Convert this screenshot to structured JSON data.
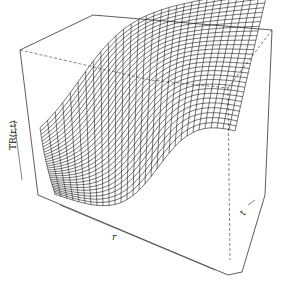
{
  "chart_data": {
    "type": "surface3d",
    "title": "",
    "xlabel": "r",
    "ylabel": "t",
    "zlabel": "TR(r,t)",
    "grid_lines_r": 30,
    "grid_lines_t": 30,
    "zlim": [
      0,
      1
    ],
    "ticks": "none",
    "box": true,
    "line_color": "#1a1a1a",
    "box_color": "#333333"
  },
  "labels": {
    "z": "TR(r,t)",
    "x": "r",
    "y": "t"
  }
}
